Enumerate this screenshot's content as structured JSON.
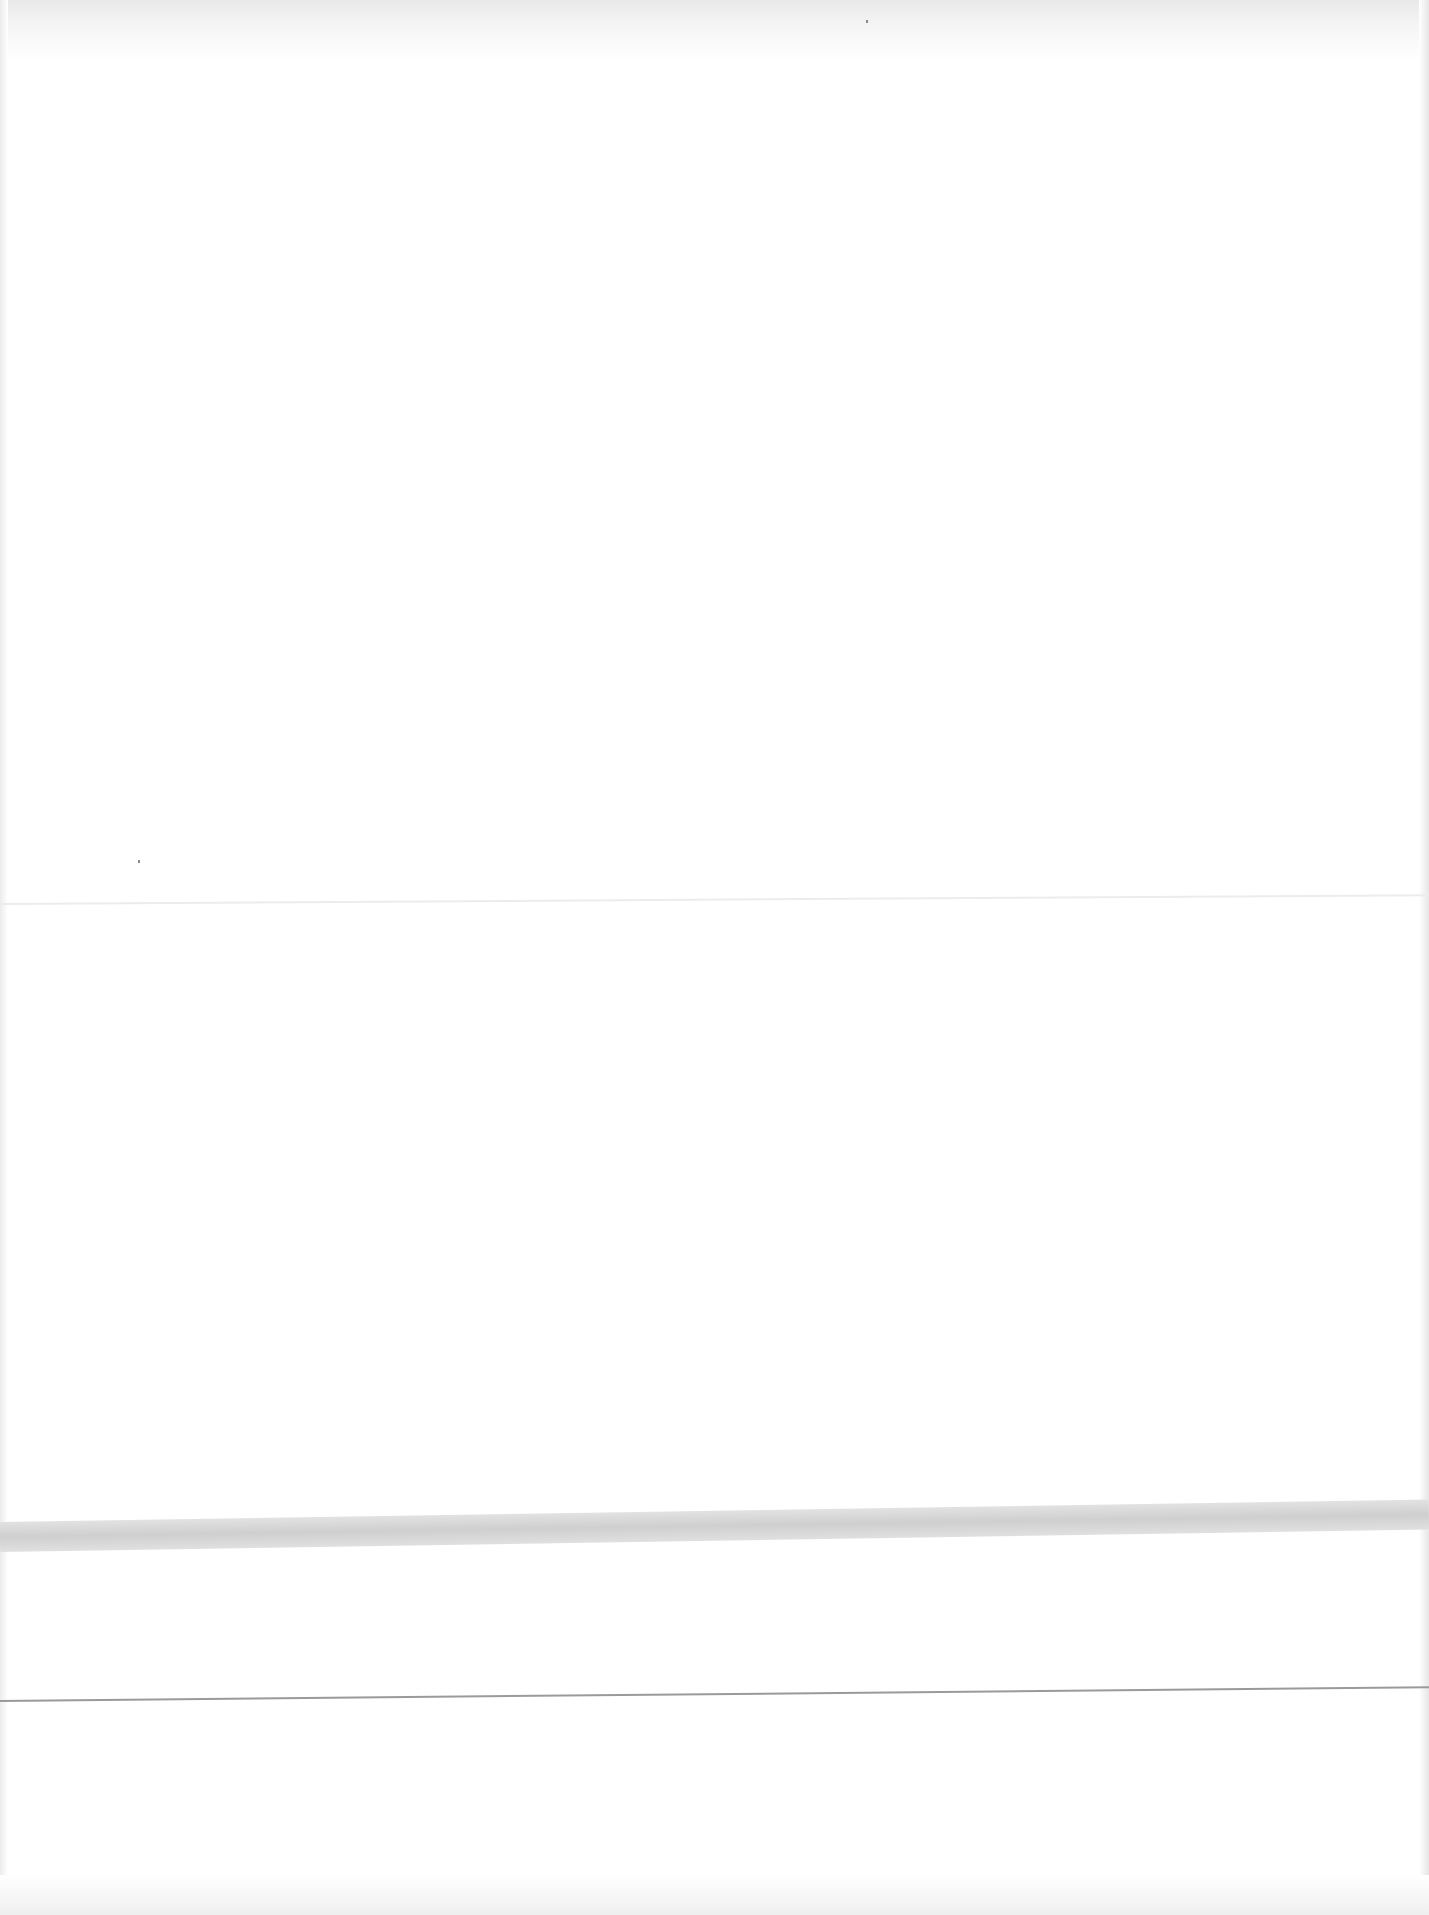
{
  "document": {
    "type": "blank scanned page",
    "text_content": ""
  }
}
